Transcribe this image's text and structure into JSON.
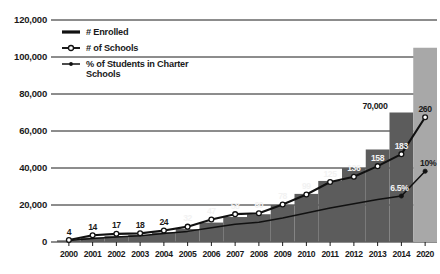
{
  "chart_data": {
    "type": "bar",
    "title": "",
    "subtitle": "",
    "xlabel": "",
    "ylabel": "",
    "ylim": [
      0,
      120000
    ],
    "ytick_values": [
      0,
      20000,
      40000,
      60000,
      80000,
      100000,
      120000
    ],
    "ytick_labels": [
      "0",
      "20,000",
      "40,000",
      "60,000",
      "80,000",
      "100,000",
      "120,000"
    ],
    "grid": true,
    "legend_position": "upper-left-inside",
    "categories": [
      "2000",
      "2001",
      "2002",
      "2003",
      "2004",
      "2005",
      "2006",
      "2007",
      "2008",
      "2009",
      "2010",
      "2011",
      "2012",
      "2013",
      "2014",
      "2020"
    ],
    "series": [
      {
        "name": "# Enrolled",
        "type": "bar",
        "values": [
          900,
          2400,
          3200,
          3800,
          5200,
          7000,
          10500,
          13500,
          15000,
          20000,
          26000,
          33000,
          40000,
          50000,
          70000,
          105000
        ],
        "data_labels": [
          "",
          "",
          "",
          "",
          "",
          "",
          "",
          "",
          "",
          "",
          "",
          "",
          "",
          "",
          "70,000",
          ""
        ],
        "colors": {
          "actual": "#5c5c5c",
          "projected": "#a8a8a8"
        },
        "projected_indices": [
          15
        ]
      },
      {
        "name": "# of Schools",
        "type": "line",
        "values": [
          4,
          14,
          17,
          18,
          24,
          32,
          47,
          58,
          60,
          78,
          99,
          125,
          136,
          158,
          183,
          260
        ],
        "data_labels": [
          "4",
          "14",
          "17",
          "18",
          "24",
          "32",
          "47",
          "58",
          "60",
          "78",
          "99",
          "125",
          "136",
          "158",
          "183",
          "260"
        ],
        "marker": "open-circle",
        "color": "#111111"
      },
      {
        "name": "% of Students in Charter Schools",
        "type": "line",
        "values": [
          0.2,
          0.5,
          0.7,
          0.9,
          1.2,
          1.5,
          2.0,
          2.5,
          2.8,
          3.4,
          4.1,
          4.8,
          5.4,
          6.0,
          6.5,
          10.0
        ],
        "data_labels": [
          "",
          "",
          "",
          "",
          "",
          "",
          "",
          "",
          "",
          "",
          "",
          "",
          "",
          "",
          "6.5%",
          "10%"
        ],
        "marker": "dot",
        "color": "#111111"
      }
    ],
    "legend": [
      {
        "label": "# Enrolled",
        "marker": "thick-line"
      },
      {
        "label": "# of Schools",
        "marker": "line-open-circle"
      },
      {
        "label": "% of Students in Charter Schools",
        "marker": "line-dot"
      }
    ]
  }
}
